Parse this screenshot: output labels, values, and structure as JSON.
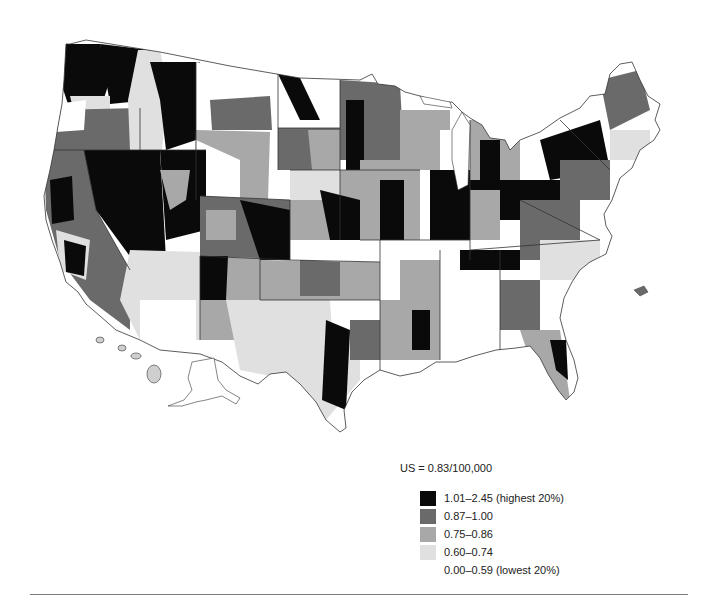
{
  "map": {
    "subject": "United States county-level rate map (choropleth), grayscale",
    "regions_shown": [
      "Contiguous United States",
      "Alaska (inset)",
      "Hawaii (inset)"
    ]
  },
  "summary": {
    "us_rate_label": "US = 0.83/100,000"
  },
  "legend": {
    "items": [
      {
        "label": "1.01–2.45 (highest 20%)",
        "color": "#0a0a0a"
      },
      {
        "label": "0.87–1.00",
        "color": "#6a6a6a"
      },
      {
        "label": "0.75–0.86",
        "color": "#a8a8a8"
      },
      {
        "label": "0.60–0.74",
        "color": "#e0e0e0"
      },
      {
        "label": "0.00–0.59 (lowest 20%)",
        "color": "#ffffff"
      }
    ]
  },
  "colors": {
    "state_border": "#333333",
    "rule": "#7a7a7a"
  }
}
